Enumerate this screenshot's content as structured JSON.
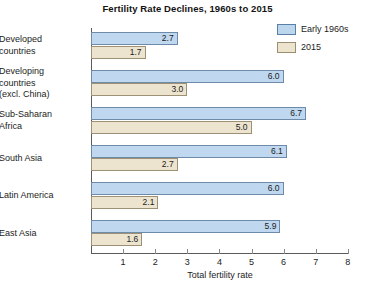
{
  "chart_data": {
    "type": "bar",
    "orientation": "horizontal",
    "title": "Fertility Rate Declines, 1960s to 2015",
    "xlabel": "Total fertility rate",
    "ylabel": "",
    "xlim": [
      0,
      8
    ],
    "xticks": [
      1,
      2,
      3,
      4,
      5,
      6,
      7,
      8
    ],
    "xtick_labels": [
      "1",
      "2",
      "3",
      "4",
      "5",
      "6",
      "7",
      "8"
    ],
    "grid": false,
    "legend_position": "top-right",
    "categories": [
      "Developed countries",
      "Developing countries (excl. China)",
      "Sub-Saharan Africa",
      "South Asia",
      "Latin America",
      "East Asia"
    ],
    "category_lines": [
      [
        "Developed",
        "countries"
      ],
      [
        "Developing",
        "countries",
        "(excl. China)"
      ],
      [
        "Sub-Saharan",
        "Africa"
      ],
      [
        "South Asia"
      ],
      [
        "Latin America"
      ],
      [
        "East Asia"
      ]
    ],
    "series": [
      {
        "name": "Early 1960s",
        "color": "#bfd8ef",
        "border_color": "#6d8aa8",
        "values": [
          2.7,
          6.0,
          6.7,
          6.1,
          6.0,
          5.9
        ],
        "labels": [
          "2.7",
          "6.0",
          "6.7",
          "6.1",
          "6.0",
          "5.9"
        ]
      },
      {
        "name": "2015",
        "color": "#ece4ce",
        "border_color": "#9c9174",
        "values": [
          1.7,
          3.0,
          5.0,
          2.7,
          2.1,
          1.6
        ],
        "labels": [
          "1.7",
          "3.0",
          "5.0",
          "2.7",
          "2.1",
          "1.6"
        ]
      }
    ]
  },
  "legend": {
    "items": [
      {
        "label": "Early 1960s",
        "swatch": "blue"
      },
      {
        "label": "2015",
        "swatch": "tan"
      }
    ]
  }
}
